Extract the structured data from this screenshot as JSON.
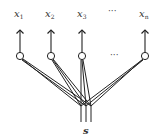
{
  "diagram": {
    "outputs": [
      {
        "base": "x",
        "sub": "1"
      },
      {
        "base": "x",
        "sub": "2"
      },
      {
        "base": "x",
        "sub": "3"
      },
      {
        "base": "x",
        "sub": "n"
      }
    ],
    "ellipsis": "···",
    "input_label": "s",
    "colors": {
      "stroke": "#222222",
      "node_fill": "#ffffff"
    }
  }
}
